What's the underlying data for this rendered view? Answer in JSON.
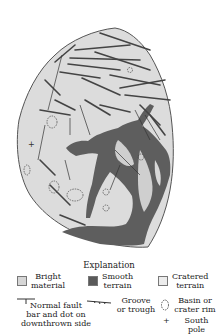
{
  "figure": {
    "colors": {
      "bright_material": "#dcdcdc",
      "smooth_terrain": "#5a5a5a",
      "cratered_terrain": "#e8e8e8",
      "outline": "#555555",
      "lineament": "#444444"
    }
  },
  "legend": {
    "title": "Explanation",
    "units": [
      {
        "name": "bright-material",
        "line1": "Bright",
        "line2": "material",
        "color": "#d6d6d6"
      },
      {
        "name": "smooth-terrain",
        "line1": "Smooth",
        "line2": "terrain",
        "color": "#5a5a5a"
      },
      {
        "name": "cratered-terrain",
        "line1": "Cratered",
        "line2": "terrain",
        "color": "#ececec"
      }
    ],
    "symbols": {
      "normal_fault": {
        "line1": "Normal fault",
        "line2": "bar and dot on",
        "line3": "downthrown side"
      },
      "groove": {
        "line1": "Groove",
        "line2": "or trough"
      },
      "basin": {
        "line1": "Basin or",
        "line2": "crater rim"
      },
      "south_pole": {
        "label": "South pole",
        "glyph": "+"
      }
    }
  }
}
